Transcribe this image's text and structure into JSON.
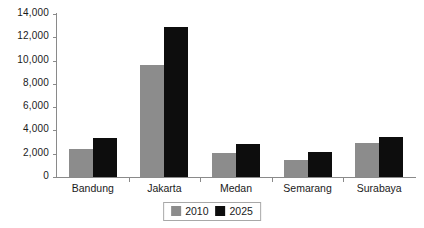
{
  "chart_data": {
    "type": "bar",
    "title": "",
    "subtitle": "",
    "xlabel": "",
    "ylabel": "",
    "grid": false,
    "legend_position": "bottom",
    "categories": [
      "Bandung",
      "Jakarta",
      "Medan",
      "Semarang",
      "Surabaya"
    ],
    "series": [
      {
        "name": "2010",
        "color": "#8c8c8c",
        "values": [
          2400,
          9620,
          2060,
          1460,
          2920
        ]
      },
      {
        "name": "2025",
        "color": "#0d0d0d",
        "values": [
          3350,
          12880,
          2840,
          2180,
          3440
        ]
      }
    ],
    "ylim": [
      0,
      14000
    ],
    "ytick_values": [
      0,
      2000,
      4000,
      6000,
      8000,
      10000,
      12000,
      14000
    ],
    "ytick_labels": [
      "0",
      "2,000",
      "4,000",
      "6,000",
      "8,000",
      "10,000",
      "12,000",
      "14,000"
    ],
    "axis_color": "#8a8a8a"
  }
}
